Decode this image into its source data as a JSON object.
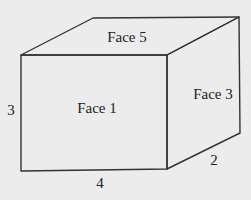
{
  "diagram": {
    "type": "rectangular-prism",
    "stroke_color": "#333333",
    "background_color": "#ececec",
    "faces": [
      {
        "id": "face-1",
        "label": "Face 1",
        "position": "front"
      },
      {
        "id": "face-3",
        "label": "Face 3",
        "position": "right-side"
      },
      {
        "id": "face-5",
        "label": "Face 5",
        "position": "top"
      }
    ],
    "dimensions": [
      {
        "id": "height",
        "label": "3",
        "edge": "front-left"
      },
      {
        "id": "length",
        "label": "4",
        "edge": "front-bottom"
      },
      {
        "id": "depth",
        "label": "2",
        "edge": "right-bottom"
      }
    ]
  }
}
